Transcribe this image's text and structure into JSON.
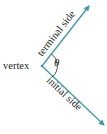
{
  "diagram": {
    "type": "angle",
    "labels": {
      "vertex": "vertex",
      "terminal_side": "terminal side",
      "initial_side": "initial side",
      "angle_symbol": "θ"
    },
    "colors": {
      "ray": "#3a9aa8",
      "text": "#231f20",
      "arc": "#231f20"
    }
  }
}
